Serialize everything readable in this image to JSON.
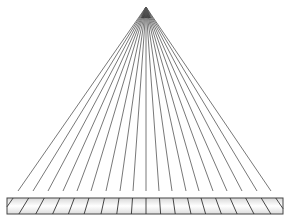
{
  "diagram": {
    "type": "ray-fan-projection",
    "apex": {
      "x": 146,
      "y": 7
    },
    "ray_end_y": 191,
    "ray_end_xs": [
      18,
      33,
      48,
      63,
      77,
      91,
      106,
      120,
      133,
      146,
      159,
      172,
      186,
      199,
      213,
      227,
      242,
      257,
      271
    ],
    "bar": {
      "x": 7,
      "y": 198,
      "width": 276,
      "height": 16
    },
    "colors": {
      "ray": "#555555",
      "bar_stroke": "#444444",
      "bar_fill_top": "#d8d8d8",
      "bar_fill_mid": "#ffffff",
      "bar_fill_bottom": "#dcdcdc",
      "divider": "#333333"
    }
  }
}
